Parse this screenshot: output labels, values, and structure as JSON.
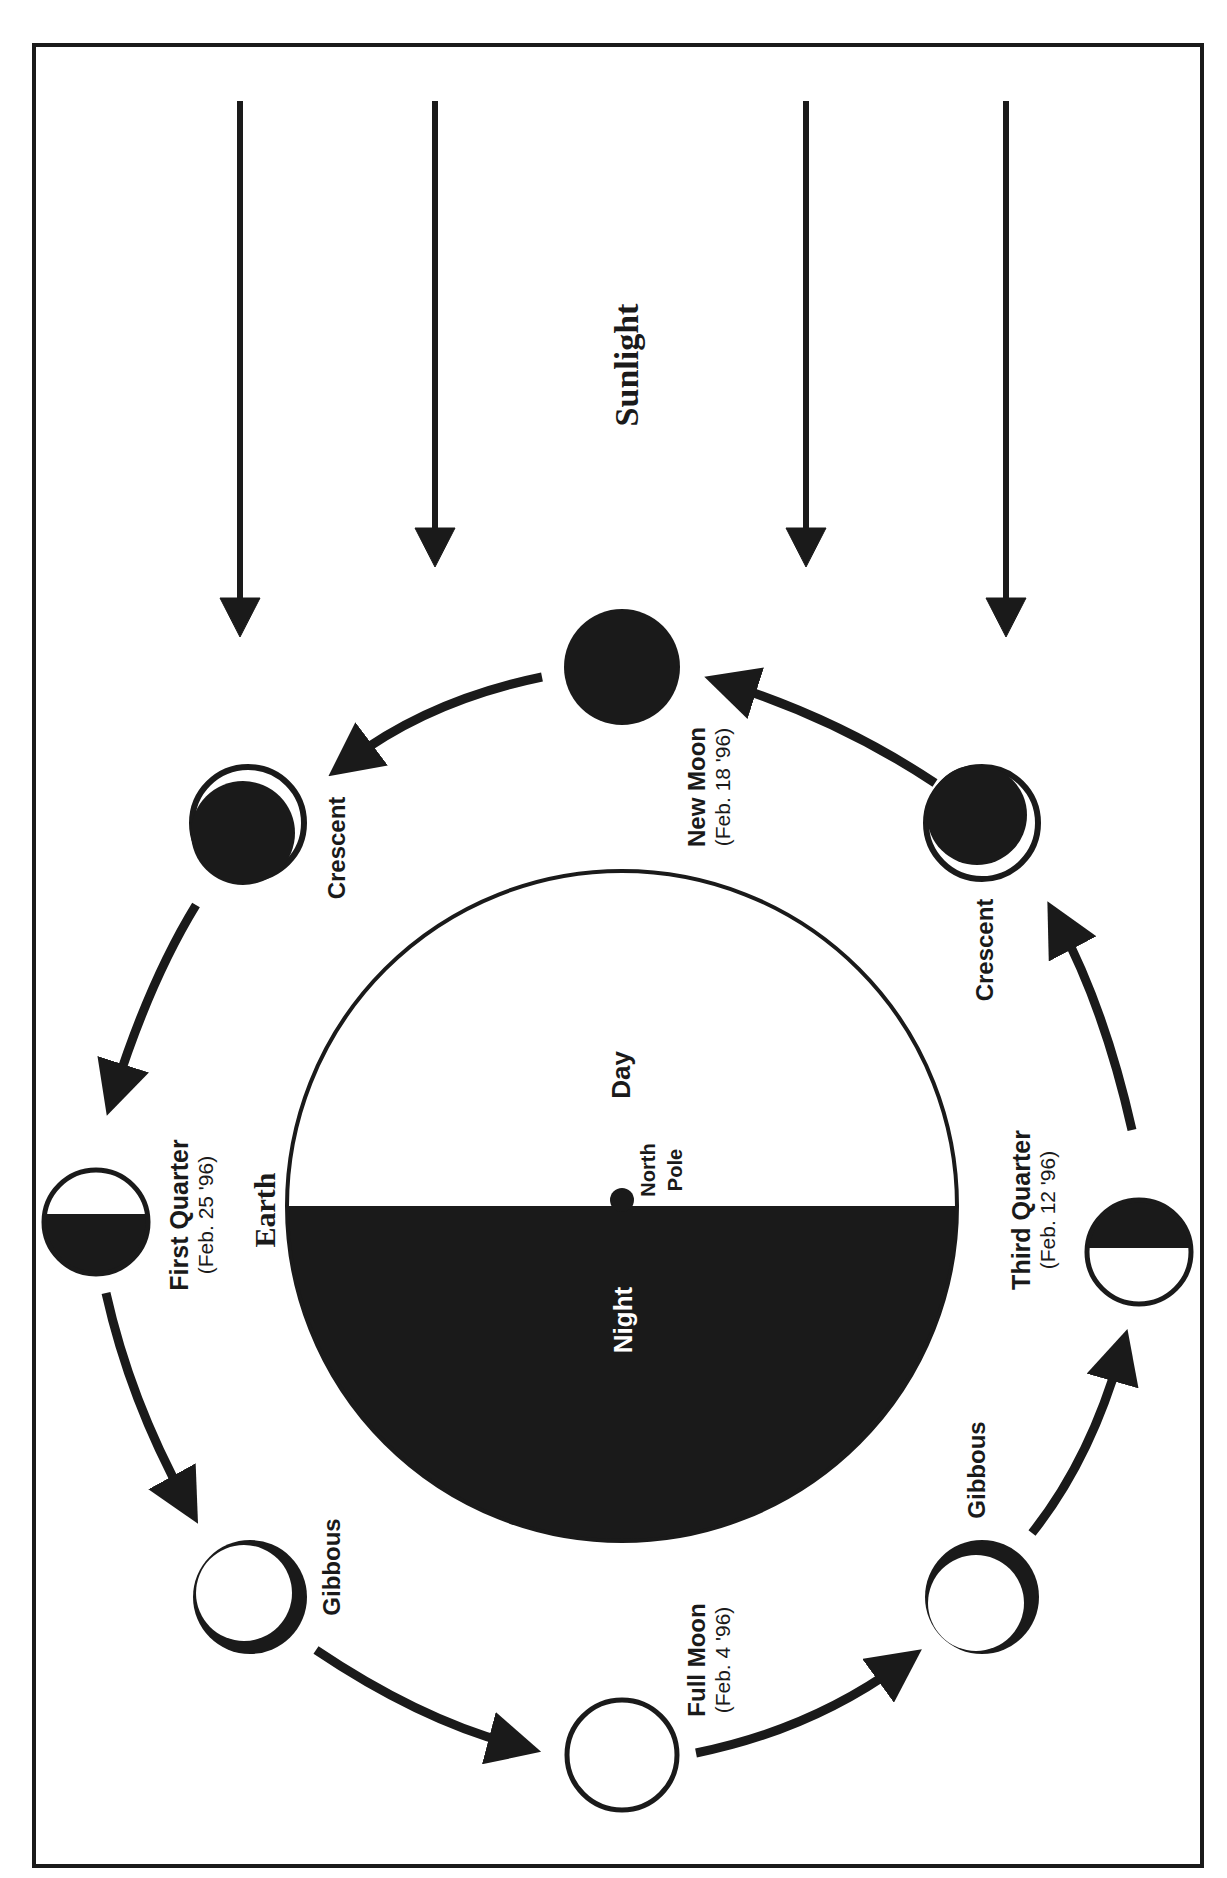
{
  "diagram": {
    "sunlight_label": "Sunlight",
    "earth": {
      "label": "Earth",
      "day_label": "Day",
      "night_label": "Night",
      "pole_label_line1": "North",
      "pole_label_line2": "Pole"
    },
    "phases": [
      {
        "id": "new-moon",
        "name": "New Moon",
        "date": "(Feb. 18 '96)"
      },
      {
        "id": "waxing-crescent",
        "name": "Crescent",
        "date": ""
      },
      {
        "id": "first-quarter",
        "name": "First Quarter",
        "date": "(Feb. 25 '96)"
      },
      {
        "id": "waxing-gibbous",
        "name": "Gibbous",
        "date": ""
      },
      {
        "id": "full-moon",
        "name": "Full Moon",
        "date": "(Feb. 4 '96)"
      },
      {
        "id": "waning-gibbous",
        "name": "Gibbous",
        "date": ""
      },
      {
        "id": "third-quarter",
        "name": "Third Quarter",
        "date": "(Feb. 12 '96)"
      },
      {
        "id": "waning-crescent",
        "name": "Crescent",
        "date": ""
      }
    ],
    "colors": {
      "ink": "#1a1a1a",
      "paper": "#ffffff"
    }
  }
}
